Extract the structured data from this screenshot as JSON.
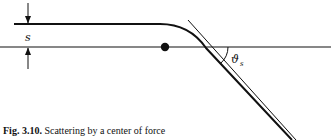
{
  "figure": {
    "caption_label": "Fig. 3.10.",
    "caption_text": "Scattering by a center of force",
    "impact_parameter_label": "s",
    "angle_label_main": "ϑ",
    "angle_label_sub": "s",
    "colors": {
      "ink": "#111111",
      "background": "#ffffff"
    }
  }
}
